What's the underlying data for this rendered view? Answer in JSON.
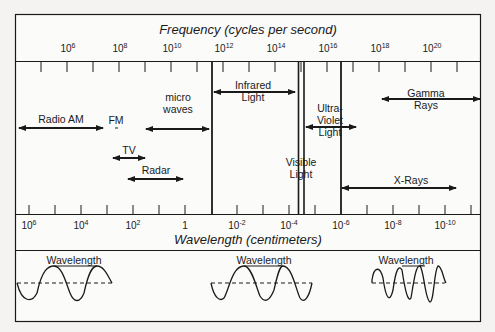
{
  "title_top": "Frequency (cycles per second)",
  "title_bottom": "Wavelength (centimeters)",
  "frequency_ticks": [
    {
      "base": "10",
      "exp": "6",
      "x": 68
    },
    {
      "base": "10",
      "exp": "8",
      "x": 120
    },
    {
      "base": "10",
      "exp": "10",
      "x": 172
    },
    {
      "base": "10",
      "exp": "12",
      "x": 224
    },
    {
      "base": "10",
      "exp": "14",
      "x": 276
    },
    {
      "base": "10",
      "exp": "16",
      "x": 328
    },
    {
      "base": "10",
      "exp": "18",
      "x": 380
    },
    {
      "base": "10",
      "exp": "20",
      "x": 432
    }
  ],
  "wavelength_ticks": [
    {
      "base": "10",
      "exp": "6",
      "x": 29
    },
    {
      "base": "10",
      "exp": "4",
      "x": 81
    },
    {
      "base": "10",
      "exp": "2",
      "x": 133
    },
    {
      "base": "1",
      "exp": "",
      "x": 185
    },
    {
      "base": "10",
      "exp": "-2",
      "x": 237
    },
    {
      "base": "10",
      "exp": "-4",
      "x": 289
    },
    {
      "base": "10",
      "exp": "-6",
      "x": 341
    },
    {
      "base": "10",
      "exp": "-8",
      "x": 393
    },
    {
      "base": "10",
      "exp": "-10",
      "x": 445
    }
  ],
  "bands": [
    {
      "label": "Radio AM",
      "lines": [
        "Radio AM"
      ]
    },
    {
      "label": "FM",
      "lines": [
        "FM"
      ]
    },
    {
      "label": "TV",
      "lines": [
        "TV"
      ]
    },
    {
      "label": "Radar",
      "lines": [
        "Radar"
      ]
    },
    {
      "label": "micro waves",
      "lines": [
        "micro",
        "waves"
      ]
    },
    {
      "label": "Infrared Light",
      "lines": [
        "Infrared",
        "Light"
      ]
    },
    {
      "label": "Visible Light",
      "lines": [
        "Visible",
        "Light"
      ]
    },
    {
      "label": "Ultra-Violet Light",
      "lines": [
        "Ultra-",
        "Violet",
        "Light"
      ]
    },
    {
      "label": "Gamma Rays",
      "lines": [
        "Gamma",
        "Rays"
      ]
    },
    {
      "label": "X-Rays",
      "lines": [
        "X-Rays"
      ]
    }
  ],
  "waves": [
    {
      "label": "Wavelength",
      "cycles": "long"
    },
    {
      "label": "Wavelength",
      "cycles": "medium"
    },
    {
      "label": "Wavelength",
      "cycles": "short"
    }
  ]
}
